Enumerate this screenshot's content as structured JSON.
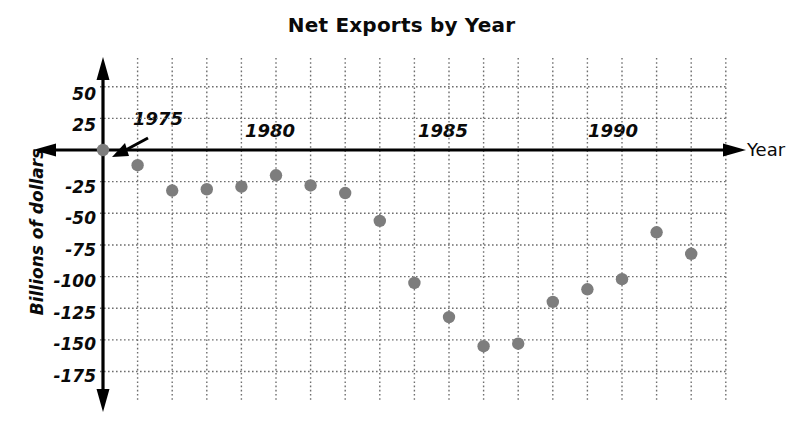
{
  "chart_data": {
    "type": "scatter",
    "title": "Net Exports by Year",
    "xlabel": "Year",
    "ylabel": "Billions of dollars",
    "x": [
      1973,
      1974,
      1975,
      1976,
      1977,
      1978,
      1979,
      1980,
      1981,
      1982,
      1983,
      1984,
      1985,
      1986,
      1987,
      1988,
      1989,
      1990
    ],
    "values": [
      0,
      -12,
      -32,
      -31,
      -29,
      -20,
      -28,
      -34,
      -56,
      -105,
      -132,
      -155,
      -153,
      -120,
      -110,
      -102,
      -65,
      -82
    ],
    "series": [
      {
        "name": "Net Exports",
        "values": [
          0,
          -12,
          -32,
          -31,
          -29,
          -20,
          -28,
          -34,
          -56,
          -105,
          -132,
          -155,
          -153,
          -120,
          -110,
          -102,
          -65,
          -82
        ]
      }
    ],
    "y_tick_labels": [
      "50",
      "25",
      "-25",
      "-50",
      "-75",
      "-100",
      "-125",
      "-150",
      "-175"
    ],
    "y_ticks": [
      50,
      25,
      -25,
      -50,
      -75,
      -100,
      -125,
      -150,
      -175
    ],
    "x_tick_labels": [
      "1975",
      "1980",
      "1985",
      "1990"
    ],
    "x_ticks": [
      1975,
      1980,
      1985,
      1990
    ],
    "xlim": [
      1972.5,
      1991.5
    ],
    "ylim": [
      -187,
      62
    ],
    "grid": true,
    "legend": "none",
    "marker_color": "#7d7d7d",
    "axis_color": "#000000",
    "grid_color": "#6e6e6e",
    "annotation": {
      "text": "1975",
      "note": "arrow pointing from the 1975 label to the leftmost data point"
    }
  },
  "axes": {
    "y_labels": [
      {
        "text": "50",
        "top": 95
      },
      {
        "text": "25",
        "top": 126
      },
      {
        "text": "-25",
        "top": 188
      },
      {
        "text": "-50",
        "top": 219
      },
      {
        "text": "-75",
        "top": 251
      },
      {
        "text": "-100",
        "top": 282
      },
      {
        "text": "-125",
        "top": 314
      },
      {
        "text": "-150",
        "top": 345
      },
      {
        "text": "-175",
        "top": 377
      }
    ],
    "x_labels": [
      {
        "text": "1975",
        "left": 133,
        "top": 108
      },
      {
        "text": "1980",
        "left": 245,
        "top": 120
      },
      {
        "text": "1985",
        "left": 418,
        "top": 120
      },
      {
        "text": "1990",
        "left": 588,
        "top": 120
      }
    ],
    "x_axis_title": "Year",
    "y_axis_title": "Billions of dollars"
  },
  "title": "Net Exports by Year"
}
